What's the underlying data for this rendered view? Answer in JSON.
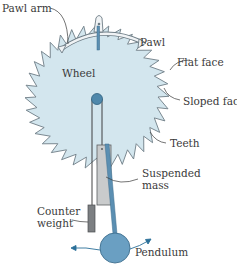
{
  "diagram": {
    "type": "escapement mechanism",
    "labels": {
      "pawl_arm": "Pawl arm",
      "pawl": "Pawl",
      "wheel": "Wheel",
      "flat_face": "Flat face",
      "sloped_face": "Sloped face",
      "teeth": "Teeth",
      "suspended_mass_line1": "Suspended",
      "suspended_mass_line2": "mass",
      "counter_weight_line1": "Counter",
      "counter_weight_line2": "weight",
      "pendulum": "Pendulum"
    },
    "colors": {
      "wheel_fill": "#d3e6ee",
      "wheel_stroke": "#6e7d86",
      "hub_fill": "#4f88ab",
      "pendulum_fill": "#6a9fc2",
      "rod_fill": "#5b8fb2",
      "mass_fill": "#c9cbcc",
      "counterweight_fill": "#7c7f82",
      "leader_lines": "#3a3a3a",
      "arrow_color": "#2a6f99"
    },
    "wheel": {
      "teeth_count": 36
    }
  }
}
